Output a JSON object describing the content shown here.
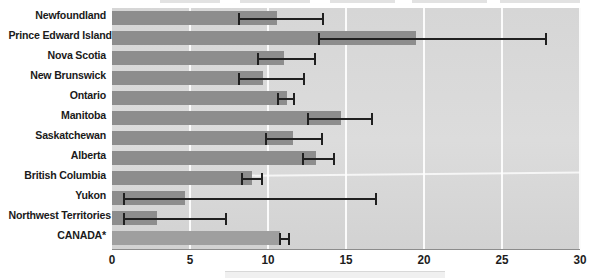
{
  "chart_data": {
    "type": "bar",
    "orientation": "horizontal",
    "title": "",
    "xlabel": "",
    "ylabel": "",
    "xlim": [
      0,
      30
    ],
    "xticks": [
      0,
      5,
      10,
      15,
      20,
      25,
      30
    ],
    "xticklabels": [
      "0",
      "5",
      "10",
      "15",
      "20",
      "25",
      "30"
    ],
    "grid": true,
    "grid_axis": "x",
    "legend": "none",
    "error_bars": true,
    "categories": [
      "Newfoundland",
      "Prince Edward Island",
      "Nova Scotia",
      "New Brunswick",
      "Ontario",
      "Manitoba",
      "Saskatchewan",
      "Alberta",
      "British Columbia",
      "Yukon",
      "Northwest Territories",
      "CANADA*"
    ],
    "values": [
      10.6,
      19.5,
      11.0,
      9.7,
      11.2,
      14.7,
      11.6,
      13.1,
      9.0,
      4.7,
      2.9,
      10.8
    ],
    "ci_low": [
      8.1,
      13.2,
      9.3,
      8.1,
      10.6,
      12.5,
      9.8,
      12.2,
      8.3,
      0.7,
      0.7,
      10.7
    ],
    "ci_high": [
      13.6,
      27.9,
      13.1,
      12.4,
      11.7,
      16.7,
      13.5,
      14.3,
      9.7,
      17.0,
      7.4,
      11.4
    ],
    "bars": [
      {
        "category": "Newfoundland",
        "value": 10.6,
        "ci_low": 8.1,
        "ci_high": 13.6
      },
      {
        "category": "Prince Edward Island",
        "value": 19.5,
        "ci_low": 13.2,
        "ci_high": 27.9
      },
      {
        "category": "Nova Scotia",
        "value": 11.0,
        "ci_low": 9.3,
        "ci_high": 13.1
      },
      {
        "category": "New Brunswick",
        "value": 9.7,
        "ci_low": 8.1,
        "ci_high": 12.4
      },
      {
        "category": "Ontario",
        "value": 11.2,
        "ci_low": 10.6,
        "ci_high": 11.7
      },
      {
        "category": "Manitoba",
        "value": 14.7,
        "ci_low": 12.5,
        "ci_high": 16.7
      },
      {
        "category": "Saskatchewan",
        "value": 11.6,
        "ci_low": 9.8,
        "ci_high": 13.5
      },
      {
        "category": "Alberta",
        "value": 13.1,
        "ci_low": 12.2,
        "ci_high": 14.3
      },
      {
        "category": "British Columbia",
        "value": 9.0,
        "ci_low": 8.3,
        "ci_high": 9.7
      },
      {
        "category": "Yukon",
        "value": 4.7,
        "ci_low": 0.7,
        "ci_high": 17.0
      },
      {
        "category": "Northwest Territories",
        "value": 2.9,
        "ci_low": 0.7,
        "ci_high": 7.4
      },
      {
        "category": "CANADA*",
        "value": 10.8,
        "ci_low": 10.7,
        "ci_high": 11.4
      }
    ]
  },
  "colors": {
    "bar_fill": "#8d8d8d",
    "bar_fill_total": "#9f9f9f",
    "plot_background": "#d9d9d9",
    "gridline": "#fbfbfb",
    "error_bar": "#202020",
    "label_text": "#1a1a1a",
    "tick_text": "#1d1d1d",
    "page_background": "#ffffff"
  }
}
